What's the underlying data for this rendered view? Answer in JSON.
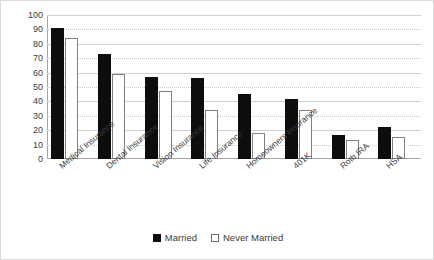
{
  "chart_data": {
    "type": "bar",
    "title": "",
    "subtitle": "",
    "xlabel": "",
    "ylabel": "",
    "ylim": [
      0,
      100
    ],
    "ytick_step": 10,
    "yticks": [
      "100",
      "90",
      "80",
      "70",
      "60",
      "50",
      "40",
      "30",
      "20",
      "10",
      "0"
    ],
    "grid": true,
    "grid_orientation": "horizontal",
    "legend_position": "bottom-center",
    "categories": [
      "Medical Insurance",
      "Dental Insurance",
      "Vision Insurance",
      "Life Insurance",
      "Homeowners Insurance",
      "401K",
      "Roth IRA",
      "HSA"
    ],
    "series": [
      {
        "name": "Married",
        "color": "#0d0d0d",
        "style": "filled",
        "values": [
          91,
          73,
          57,
          56,
          45,
          42,
          17,
          22
        ]
      },
      {
        "name": "Never Married",
        "color": "#ffffff",
        "style": "hollow",
        "values": [
          84,
          59,
          47,
          34,
          18,
          34,
          13,
          15
        ]
      }
    ]
  },
  "legend": {
    "items": [
      {
        "label": "Married",
        "swatch": "filled-square-icon"
      },
      {
        "label": "Never Married",
        "swatch": "hollow-square-icon"
      }
    ]
  },
  "colors": {
    "married": "#0d0d0d",
    "never_married": "#ffffff",
    "never_married_border": "#808080",
    "gridline": "#c9c9c9",
    "axis": "#a6a6a6",
    "text": "#3b3b3b",
    "frame": "#d9d9d9",
    "background": "#ffffff"
  }
}
